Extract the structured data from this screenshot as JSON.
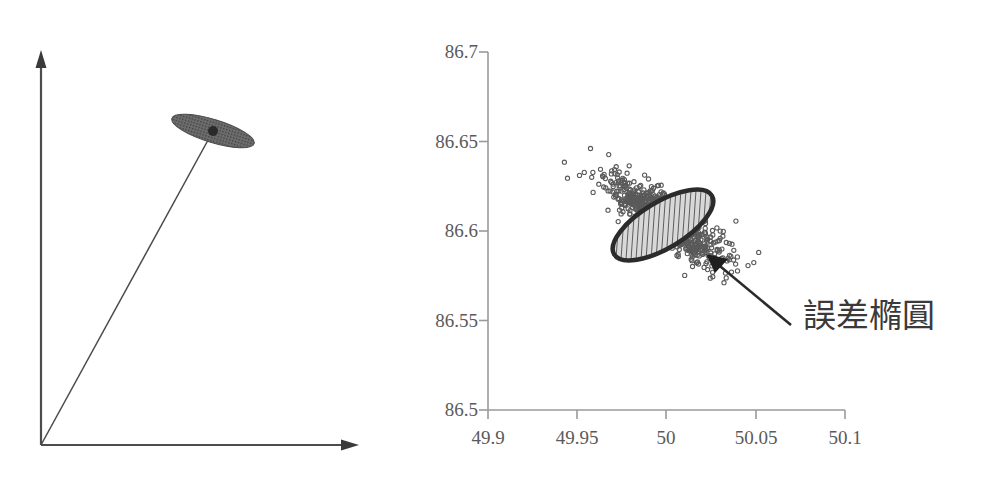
{
  "figure": {
    "panels": [
      {
        "name": "vector-error-ellipse-schematic",
        "description": "schematic of a vector from the origin with an error ellipse at its tip"
      },
      {
        "name": "scatter-error-ellipse-plot",
        "description": "scatter plot of coordinate samples with a fitted error ellipse"
      }
    ]
  },
  "schematic": {
    "y_axis_name": "y-axis-arrow",
    "x_axis_name": "x-axis-arrow",
    "vector_name": "position-vector",
    "ellipse_name": "error-ellipse-shape",
    "point_name": "estimated-point"
  },
  "annotation": {
    "label": "誤差橢圓",
    "leader_name": "annotation-leader-line"
  },
  "chart_data": {
    "type": "scatter",
    "title": "",
    "xlabel": "",
    "ylabel": "",
    "xlim": [
      49.9,
      50.1
    ],
    "ylim": [
      86.5,
      86.7
    ],
    "xticks": [
      "49.9",
      "49.95",
      "50",
      "50.05",
      "50.1"
    ],
    "yticks": [
      "86.5",
      "86.55",
      "86.6",
      "86.65",
      "86.7"
    ],
    "xtick_values": [
      49.9,
      49.95,
      50,
      50.05,
      50.1
    ],
    "ytick_values": [
      86.5,
      86.55,
      86.6,
      86.65,
      86.7
    ],
    "grid": false,
    "legend": null,
    "marker": "open-circle",
    "marker_color": "#555555",
    "n_points": 900,
    "distribution": {
      "mean_x": 50.0,
      "mean_y": 86.6055,
      "sd_x": 0.0165,
      "sd_y": 0.0118,
      "correlation": -0.82
    },
    "ellipse": {
      "center_x": 49.9975,
      "center_y": 86.6035,
      "semi_major": 0.0262,
      "semi_minor": 0.0092,
      "angle_deg": -30,
      "fill": "diagonal-hatch",
      "edge_color": "#2b2b2b",
      "label": "誤差橢圓"
    },
    "annotations": [
      {
        "text": "誤差橢圓",
        "point_x": 50.0125,
        "point_y": 86.5935,
        "text_x": 50.06,
        "text_y": 86.565
      }
    ]
  }
}
